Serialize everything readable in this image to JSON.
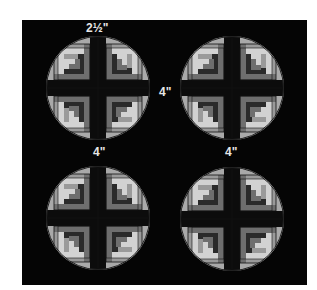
{
  "diagram": {
    "type": "quilt-block-layout",
    "colors": {
      "background": "#050505",
      "page": "#ffffff",
      "outer_ring": "#a9a9a9",
      "light": "#d2d2d2",
      "medium_light": "#9a9a9a",
      "medium": "#6e6e6e",
      "dark": "#404040",
      "darker": "#2a2a2a",
      "center_cross": "#0c0c0c",
      "seam": "#111111",
      "label": "#e6e6e6"
    },
    "labels": {
      "top_margin": "2½\"",
      "horizontal_gap": "4\"",
      "bottom_left_gap": "4\"",
      "bottom_right_gap": "4\""
    },
    "blocks": [
      {
        "name": "block-top-left",
        "position": "top-left"
      },
      {
        "name": "block-top-right",
        "position": "top-right"
      },
      {
        "name": "block-bottom-left",
        "position": "bottom-left"
      },
      {
        "name": "block-bottom-right",
        "position": "bottom-right"
      }
    ]
  }
}
